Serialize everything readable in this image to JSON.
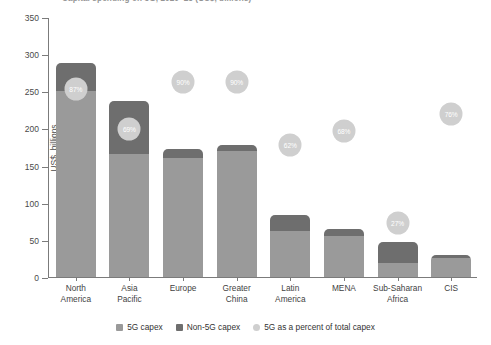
{
  "chart_data": {
    "type": "bar",
    "title": "Capital spending on 5G, 2020–25 (US$, billions)",
    "xlabel": "",
    "ylabel": "US$, billions",
    "ylim": [
      0,
      350
    ],
    "yticks": [
      0,
      50,
      100,
      150,
      200,
      250,
      300,
      350
    ],
    "grid": false,
    "legend_position": "bottom",
    "stacked": true,
    "categories": [
      "North America",
      "Asia Pacific",
      "Europe",
      "Greater China",
      "Latin America",
      "MENA",
      "Sub-Saharan Africa",
      "CIS"
    ],
    "series": [
      {
        "name": "5G capex",
        "color": "#9a9a9a",
        "values": [
          250,
          166,
          160,
          170,
          62,
          55,
          19,
          26
        ]
      },
      {
        "name": "Non-5G capex",
        "color": "#6e6e6e",
        "values": [
          38,
          71,
          12,
          8,
          21,
          10,
          28,
          4
        ]
      }
    ],
    "totals": [
      288,
      237,
      172,
      178,
      83,
      65,
      47,
      30
    ],
    "bubble_series": {
      "name": "5G as a percent of total capex",
      "color": "#cfcfcf",
      "label_color": "#ffffff",
      "values": [
        87,
        69,
        90,
        90,
        62,
        68,
        27,
        76
      ],
      "labels": [
        "87%",
        "69%",
        "90%",
        "90%",
        "62%",
        "68%",
        "27%",
        "76%"
      ]
    },
    "legend": [
      {
        "label": "5G capex",
        "color": "#9a9a9a",
        "shape": "square"
      },
      {
        "label": "Non-5G capex",
        "color": "#6e6e6e",
        "shape": "square"
      },
      {
        "label": "5G as a percent of total capex",
        "color": "#cfcfcf",
        "shape": "circle"
      }
    ]
  }
}
